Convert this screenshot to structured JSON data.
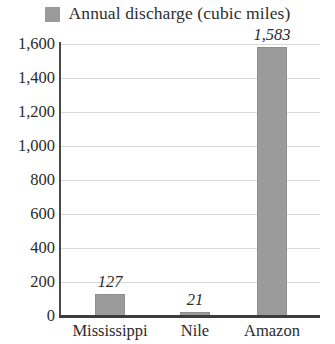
{
  "legend": {
    "swatch_icon": "legend-color-swatch",
    "label": "Annual discharge (cubic miles)",
    "color": "#9b9b9b"
  },
  "axis": {
    "y_ticks": [
      "0",
      "200",
      "400",
      "600",
      "800",
      "1,000",
      "1,200",
      "1,400",
      "1,600"
    ],
    "x_categories": [
      "Mississippi",
      "Nile",
      "Amazon"
    ]
  },
  "bars": [
    {
      "category": "Mississippi",
      "value": 127,
      "label": "127"
    },
    {
      "category": "Nile",
      "value": 21,
      "label": "21"
    },
    {
      "category": "Amazon",
      "value": 1583,
      "label": "1,583"
    }
  ],
  "chart_data": {
    "type": "bar",
    "title": "",
    "subtitle": "",
    "xlabel": "",
    "ylabel": "",
    "categories": [
      "Mississippi",
      "Nile",
      "Amazon"
    ],
    "values": [
      127,
      21,
      1583
    ],
    "data_labels": [
      "127",
      "21",
      "1,583"
    ],
    "series": [
      {
        "name": "Annual discharge (cubic miles)",
        "values": [
          127,
          21,
          1583
        ],
        "color": "#9b9b9b"
      }
    ],
    "ylim": [
      0,
      1600
    ],
    "ytick_step": 200,
    "ytick_values": [
      0,
      200,
      400,
      600,
      800,
      1000,
      1200,
      1400,
      1600
    ],
    "ytick_labels": [
      "0",
      "200",
      "400",
      "600",
      "800",
      "1,000",
      "1,200",
      "1,400",
      "1,600"
    ],
    "grid": "horizontal",
    "legend_position": "top-center",
    "legend_entries": [
      "Annual discharge (cubic miles)"
    ],
    "annotations": []
  }
}
